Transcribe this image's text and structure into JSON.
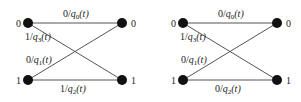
{
  "diagrams": [
    {
      "left_states": [
        "0",
        "1"
      ],
      "right_states": [
        "0",
        "1"
      ],
      "edges": {
        "top": {
          "sym": "0",
          "sub": "0"
        },
        "cross_down": {
          "sym": "1",
          "sub": "3"
        },
        "cross_up": {
          "sym": "0",
          "sub": "1"
        },
        "bottom": {
          "sym": "1",
          "sub": "2"
        }
      }
    },
    {
      "left_states": [
        "0",
        "1"
      ],
      "right_states": [
        "0",
        "1"
      ],
      "edges": {
        "top": {
          "sym": "0",
          "sub": "0"
        },
        "cross_down": {
          "sym": "1",
          "sub": "3"
        },
        "cross_up": {
          "sym": "0",
          "sub": "1"
        },
        "bottom": {
          "sym": "0",
          "sub": "2"
        }
      }
    }
  ],
  "label_fn": "q",
  "label_arg": "(t)"
}
